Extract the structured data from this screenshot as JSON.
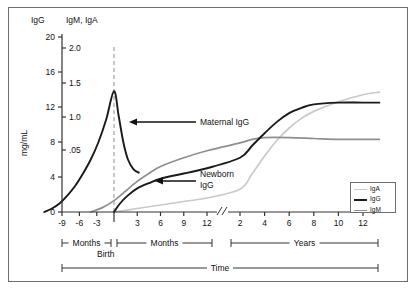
{
  "chart_data": {
    "type": "line",
    "title": "",
    "xlabel": "Time",
    "ylabel": "mg/mL",
    "grid": false,
    "legend_position": "bottom-right",
    "axis_headers": {
      "left": "IgG",
      "right": "IgM, IgA"
    },
    "y_axis_left": {
      "name": "IgG",
      "ticks": [
        "0",
        "4",
        "8",
        "12",
        "16",
        "20"
      ],
      "ylim": [
        0,
        20
      ]
    },
    "y_axis_right": {
      "name": "IgM, IgA",
      "ticks": [
        "0",
        ".05",
        "1.0",
        "1.5",
        "2.0"
      ],
      "ylim": [
        0,
        2.0
      ]
    },
    "x_axis": {
      "break_between": [
        "12 months",
        "2 years"
      ],
      "prenatal_ticks": [
        "-9",
        "-6",
        "-3"
      ],
      "postnatal_month_ticks": [
        "3",
        "6",
        "9",
        "12"
      ],
      "year_ticks": [
        "2",
        "4",
        "6",
        "8",
        "10",
        "12"
      ],
      "birth_label": "Birth",
      "brackets": [
        {
          "label": "Months",
          "segment": "prenatal"
        },
        {
          "label": "Months",
          "segment": "postnatal"
        },
        {
          "label": "Years",
          "segment": "childhood"
        }
      ],
      "master_bracket_label": "Time"
    },
    "annotations": [
      {
        "text": "Maternal IgG",
        "target": "maternal-igg-peak"
      },
      {
        "text": "Newborn IgG",
        "target": "newborn-igg-rise"
      }
    ],
    "legend": [
      {
        "label": "IgA",
        "color": "#c9c9c9",
        "width": 1.6
      },
      {
        "label": "IgG",
        "color": "#1a1a1a",
        "width": 2.6
      },
      {
        "label": "IgM",
        "color": "#8f8f8f",
        "width": 1.6
      }
    ],
    "series": [
      {
        "name": "Maternal IgG",
        "color": "#1a1a1a",
        "points": [
          [
            -9,
            0.0
          ],
          [
            -8,
            0.4
          ],
          [
            -7,
            1.0
          ],
          [
            -6,
            1.9
          ],
          [
            -5,
            3.0
          ],
          [
            -4,
            4.4
          ],
          [
            -3,
            6.0
          ],
          [
            -2,
            8.0
          ],
          [
            -1,
            10.6
          ],
          [
            0,
            13.8
          ],
          [
            0.6,
            11.0
          ],
          [
            1.2,
            8.0
          ],
          [
            1.8,
            6.0
          ],
          [
            2.5,
            4.9
          ],
          [
            3.2,
            4.5
          ]
        ]
      },
      {
        "name": "Newborn IgG",
        "color": "#1a1a1a",
        "points": [
          [
            0,
            0.0
          ],
          [
            0.8,
            1.0
          ],
          [
            1.8,
            1.9
          ],
          [
            3,
            2.7
          ],
          [
            4.5,
            3.3
          ],
          [
            6,
            3.8
          ],
          [
            9,
            4.4
          ],
          [
            12,
            5.0
          ],
          [
            24,
            6.2
          ],
          [
            36,
            7.6
          ],
          [
            48,
            9.0
          ],
          [
            60,
            10.3
          ],
          [
            72,
            11.3
          ],
          [
            84,
            11.9
          ],
          [
            96,
            12.3
          ],
          [
            120,
            12.5
          ],
          [
            144,
            12.5
          ],
          [
            160,
            12.5
          ]
        ]
      },
      {
        "name": "IgM",
        "color": "#8f8f8f",
        "points": [
          [
            -3,
            0.0
          ],
          [
            -1.5,
            0.5
          ],
          [
            0,
            1.3
          ],
          [
            1.5,
            2.4
          ],
          [
            3,
            3.5
          ],
          [
            4.5,
            4.4
          ],
          [
            6,
            5.2
          ],
          [
            9,
            6.2
          ],
          [
            12,
            7.0
          ],
          [
            24,
            7.9
          ],
          [
            36,
            8.3
          ],
          [
            48,
            8.5
          ],
          [
            72,
            8.5
          ],
          [
            96,
            8.4
          ],
          [
            120,
            8.3
          ],
          [
            144,
            8.3
          ],
          [
            160,
            8.3
          ]
        ]
      },
      {
        "name": "IgA",
        "color": "#c9c9c9",
        "points": [
          [
            0,
            0.0
          ],
          [
            3,
            0.4
          ],
          [
            6,
            0.8
          ],
          [
            9,
            1.2
          ],
          [
            12,
            1.6
          ],
          [
            24,
            2.6
          ],
          [
            36,
            4.4
          ],
          [
            48,
            6.4
          ],
          [
            60,
            8.2
          ],
          [
            72,
            9.6
          ],
          [
            84,
            10.7
          ],
          [
            96,
            11.5
          ],
          [
            120,
            12.6
          ],
          [
            144,
            13.4
          ],
          [
            160,
            13.7
          ]
        ]
      }
    ]
  }
}
